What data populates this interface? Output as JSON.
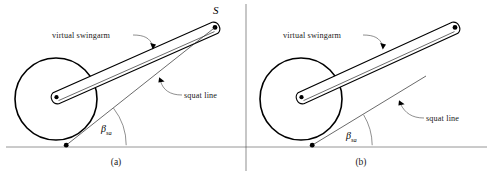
{
  "figure": {
    "background_color": "#ffffff",
    "ink_color": "#000000",
    "ground_color": "#8a8a8a",
    "width": 493,
    "height": 175
  },
  "panels": [
    {
      "id": "a",
      "caption": "(a)",
      "labels": {
        "swingarm": "virtual swingarm",
        "squat_line": "squat line",
        "angle_symbol": "β",
        "angle_subscript": "sa",
        "pivot_point": "S"
      },
      "geometry": {
        "wheel_center": [
          56,
          99
        ],
        "wheel_radius": 41,
        "hub": [
          56,
          97
        ],
        "pivot": [
          215,
          27
        ],
        "contact": [
          66,
          145
        ],
        "ground_y": 147,
        "squat_line_angle_deg": 38
      }
    },
    {
      "id": "b",
      "caption": "(b)",
      "labels": {
        "swingarm": "virtual swingarm",
        "squat_line": "squat line",
        "angle_symbol": "β",
        "angle_subscript": "sa",
        "pivot_point": ""
      },
      "geometry": {
        "wheel_center": [
          301,
          99
        ],
        "wheel_radius": 41,
        "hub": [
          301,
          97
        ],
        "pivot": [
          455,
          27
        ],
        "contact": [
          312,
          145
        ],
        "ground_y": 147,
        "squat_line_angle_deg": 31
      }
    }
  ]
}
